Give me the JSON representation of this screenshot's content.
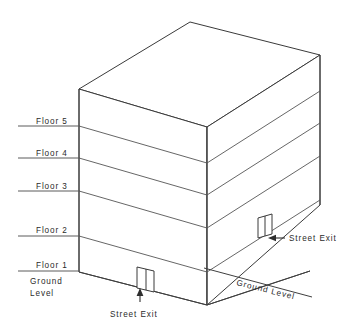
{
  "diagram": {
    "colors": {
      "line": "#3a3a3a",
      "slab": "#555555",
      "text": "#2b2b2b",
      "background": "#ffffff"
    },
    "floor_labels": [
      {
        "text": "Floor 5",
        "x": 36,
        "y": 124,
        "line_y": 126,
        "line_x1": 18,
        "line_x2": 80
      },
      {
        "text": "Floor 4",
        "x": 36,
        "y": 156,
        "line_y": 158,
        "line_x1": 18,
        "line_x2": 80
      },
      {
        "text": "Floor 3",
        "x": 36,
        "y": 189,
        "line_y": 191,
        "line_x1": 18,
        "line_x2": 80
      },
      {
        "text": "Floor 2",
        "x": 36,
        "y": 233,
        "line_y": 236,
        "line_x1": 18,
        "line_x2": 80
      },
      {
        "text": "Floor 1",
        "x": 36,
        "y": 268,
        "line_y": 271,
        "line_x1": 18,
        "line_x2": 80
      }
    ],
    "ground_label_left": {
      "line1": "Ground",
      "line2": "Level",
      "x": 30,
      "y1": 283,
      "y2": 294
    },
    "ground_label_right": {
      "text": "Ground Level",
      "x": 242,
      "y": 280,
      "rotation": 14
    },
    "street_exit_front": {
      "text": "Street Exit",
      "x": 110,
      "y": 316
    },
    "street_exit_right": {
      "text": "Street Exit",
      "x": 288,
      "y": 242
    },
    "doors": [
      {
        "name": "front-door",
        "panels": 2
      },
      {
        "name": "right-door",
        "panels": 2
      }
    ]
  }
}
